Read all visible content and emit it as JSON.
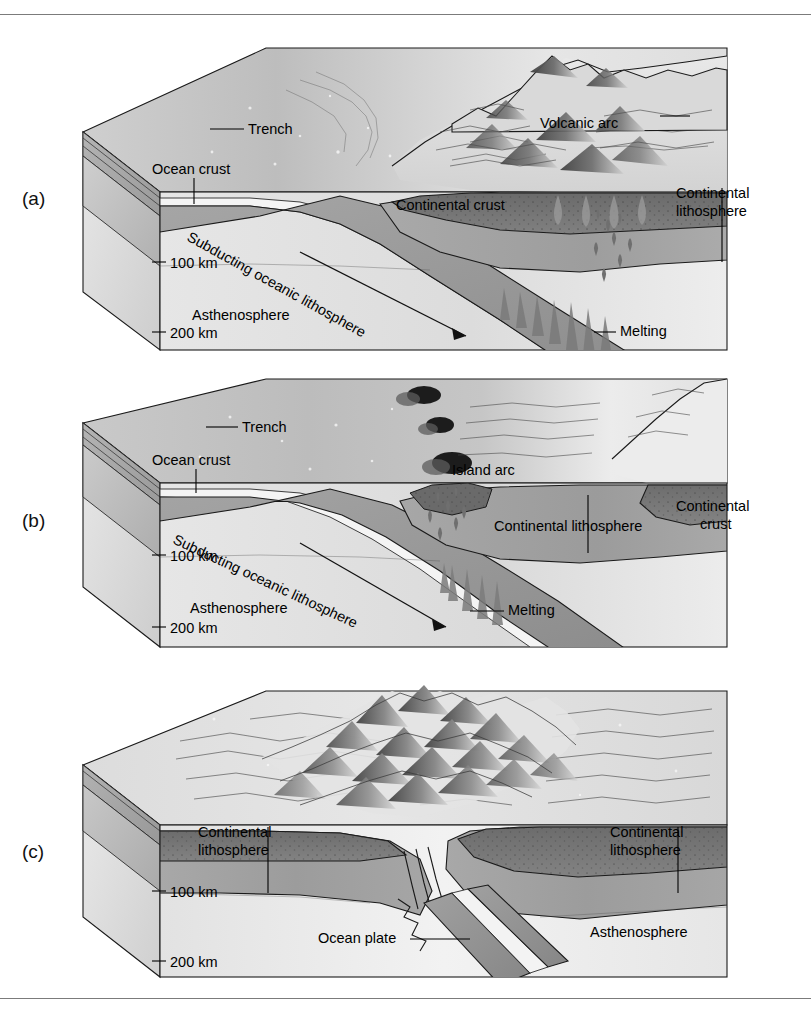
{
  "figure": {
    "panels": [
      {
        "id": "a",
        "letter": "(a)",
        "type": "ocean-continent convergence",
        "labels": [
          {
            "name": "trench",
            "text": "Trench"
          },
          {
            "name": "volcanic-arc",
            "text": "Volcanic arc"
          },
          {
            "name": "ocean-crust",
            "text": "Ocean crust"
          },
          {
            "name": "continental-crust",
            "text": "Continental crust"
          },
          {
            "name": "continental-lithosphere-line1",
            "text": "Continental"
          },
          {
            "name": "continental-lithosphere-line2",
            "text": "lithosphere"
          },
          {
            "name": "subducting-slab",
            "text": "Subducting oceanic lithosphere"
          },
          {
            "name": "asthenosphere",
            "text": "Asthenosphere"
          },
          {
            "name": "melting",
            "text": "Melting"
          }
        ],
        "depth_marks": [
          {
            "name": "depth-100",
            "text": "100 km"
          },
          {
            "name": "depth-200",
            "text": "200 km"
          }
        ]
      },
      {
        "id": "b",
        "letter": "(b)",
        "type": "ocean-ocean convergence / island arc",
        "labels": [
          {
            "name": "trench",
            "text": "Trench"
          },
          {
            "name": "island-arc",
            "text": "Island arc"
          },
          {
            "name": "ocean-crust",
            "text": "Ocean crust"
          },
          {
            "name": "continental-lithosphere",
            "text": "Continental lithosphere"
          },
          {
            "name": "continental-crust-line1",
            "text": "Continental"
          },
          {
            "name": "continental-crust-line2",
            "text": "crust"
          },
          {
            "name": "subducting-slab",
            "text": "Subducting oceanic lithosphere"
          },
          {
            "name": "asthenosphere",
            "text": "Asthenosphere"
          },
          {
            "name": "melting",
            "text": "Melting"
          }
        ],
        "depth_marks": [
          {
            "name": "depth-100",
            "text": "100 km"
          },
          {
            "name": "depth-200",
            "text": "200 km"
          }
        ]
      },
      {
        "id": "c",
        "letter": "(c)",
        "type": "continent-continent collision",
        "labels": [
          {
            "name": "continental-lithosphere-left-line1",
            "text": "Continental"
          },
          {
            "name": "continental-lithosphere-left-line2",
            "text": "lithosphere"
          },
          {
            "name": "continental-lithosphere-right-line1",
            "text": "Continental"
          },
          {
            "name": "continental-lithosphere-right-line2",
            "text": "lithosphere"
          },
          {
            "name": "ocean-plate",
            "text": "Ocean plate"
          },
          {
            "name": "asthenosphere",
            "text": "Asthenosphere"
          }
        ],
        "depth_marks": [
          {
            "name": "depth-100",
            "text": "100 km"
          },
          {
            "name": "depth-200",
            "text": "200 km"
          }
        ]
      }
    ],
    "colors": {
      "ink": "#111111",
      "edge": "#1a1a1a",
      "ocean_surface": "#b9b9b9",
      "land_surface": "#dcdcdc",
      "continental_crust": "#6e6e6e",
      "lithosphere": "#9a9a9a",
      "asthenosphere": "#e4e4e4",
      "slab": "#9d9d9d",
      "ocean_crust_band": "#f2f2f2",
      "volcano": "#585858",
      "rule": "#7b7b7b"
    }
  }
}
